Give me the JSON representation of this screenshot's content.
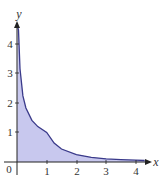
{
  "chart_data": {
    "type": "area",
    "title": "",
    "xlabel": "x",
    "ylabel": "y",
    "xlim": [
      0,
      4.3
    ],
    "ylim": [
      0,
      4.6
    ],
    "grid": false,
    "legend": null,
    "x_ticks": [
      "0",
      "1",
      "2",
      "3",
      "4"
    ],
    "y_ticks": [
      "1",
      "2",
      "3",
      "4"
    ],
    "series": [
      {
        "name": "f(x) = 1/sqrt(x) for 0<x<1, 1/x^2 for x>=1",
        "x": [
          0.05,
          0.1,
          0.2,
          0.3,
          0.5,
          0.7,
          1.0,
          1.25,
          1.5,
          2.0,
          2.5,
          3.0,
          3.5,
          4.0,
          4.3
        ],
        "y": [
          4.47,
          3.16,
          2.24,
          1.83,
          1.41,
          1.2,
          1.0,
          0.64,
          0.44,
          0.25,
          0.16,
          0.11,
          0.08,
          0.06,
          0.05
        ]
      }
    ],
    "fill_color": "#c8c8ee",
    "line_color": "#3a3a8a"
  },
  "labels": {
    "origin": "0",
    "x_axis": "x",
    "y_axis": "y",
    "x_ticks": [
      "1",
      "2",
      "3",
      "4"
    ],
    "y_ticks": [
      "1",
      "2",
      "3",
      "4"
    ]
  }
}
